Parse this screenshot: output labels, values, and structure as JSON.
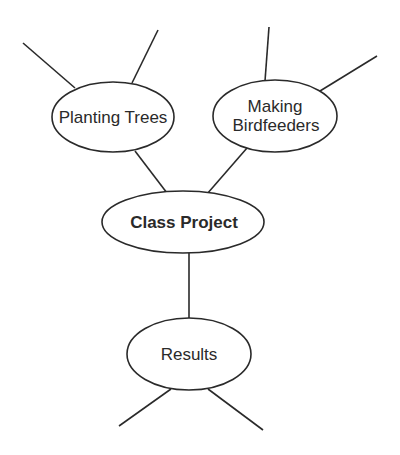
{
  "diagram": {
    "type": "web-organizer",
    "colors": {
      "stroke": "#2a2a2a",
      "fill": "#ffffff",
      "text": "#2a2a2a"
    },
    "center": {
      "label": "Class Project",
      "bold": true
    },
    "nodes": [
      {
        "id": "planting-trees",
        "lines": [
          "Planting Trees"
        ],
        "blank_branches": 2
      },
      {
        "id": "making-birdfeeders",
        "lines": [
          "Making",
          "Birdfeeders"
        ],
        "blank_branches": 2
      },
      {
        "id": "results",
        "lines": [
          "Results"
        ],
        "blank_branches": 2
      }
    ]
  }
}
